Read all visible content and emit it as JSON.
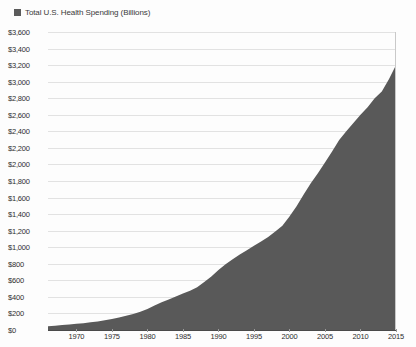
{
  "legend": {
    "marker_color": "#5b5b5b",
    "label": "Total U.S. Health Spending (Billions)"
  },
  "chart_data": {
    "type": "area",
    "title": "",
    "subtitle": "",
    "xlabel": "",
    "ylabel": "",
    "series_name": "Total U.S. Health Spending (Billions)",
    "fill_color": "#595959",
    "grid": true,
    "legend_position": "top-left",
    "xlim": [
      1966,
      2015
    ],
    "ylim": [
      0,
      3600
    ],
    "ytick_step": 200,
    "ytick_labels": [
      "$3,600",
      "$3,400",
      "$3,200",
      "$3,000",
      "$2,800",
      "$2,600",
      "$2,400",
      "$2,200",
      "$2,000",
      "$1,800",
      "$1,600",
      "$1,400",
      "$1,200",
      "$1,000",
      "$800",
      "$600",
      "$400",
      "$200",
      "$0"
    ],
    "ytick_values": [
      3600,
      3400,
      3200,
      3000,
      2800,
      2600,
      2400,
      2200,
      2000,
      1800,
      1600,
      1400,
      1200,
      1000,
      800,
      600,
      400,
      200,
      0
    ],
    "xtick_labels": [
      "1970",
      "1975",
      "1980",
      "1985",
      "1990",
      "1995",
      "2000",
      "2005",
      "2010",
      "2015"
    ],
    "xtick_values": [
      1970,
      1975,
      1980,
      1985,
      1990,
      1995,
      2000,
      2005,
      2010,
      2015
    ],
    "x": [
      1966,
      1967,
      1968,
      1969,
      1970,
      1971,
      1972,
      1973,
      1974,
      1975,
      1976,
      1977,
      1978,
      1979,
      1980,
      1981,
      1982,
      1983,
      1984,
      1985,
      1986,
      1987,
      1988,
      1989,
      1990,
      1991,
      1992,
      1993,
      1994,
      1995,
      1996,
      1997,
      1998,
      1999,
      2000,
      2001,
      2002,
      2003,
      2004,
      2005,
      2006,
      2007,
      2008,
      2009,
      2010,
      2011,
      2012,
      2013,
      2014,
      2015
    ],
    "values": [
      46,
      52,
      59,
      67,
      75,
      83,
      93,
      103,
      117,
      133,
      152,
      173,
      194,
      220,
      255,
      296,
      334,
      369,
      406,
      440,
      473,
      517,
      580,
      647,
      724,
      793,
      855,
      913,
      962,
      1017,
      1069,
      1125,
      1191,
      1260,
      1370,
      1495,
      1637,
      1772,
      1895,
      2024,
      2156,
      2296,
      2400,
      2500,
      2600,
      2690,
      2800,
      2880,
      3030,
      3200
    ]
  }
}
